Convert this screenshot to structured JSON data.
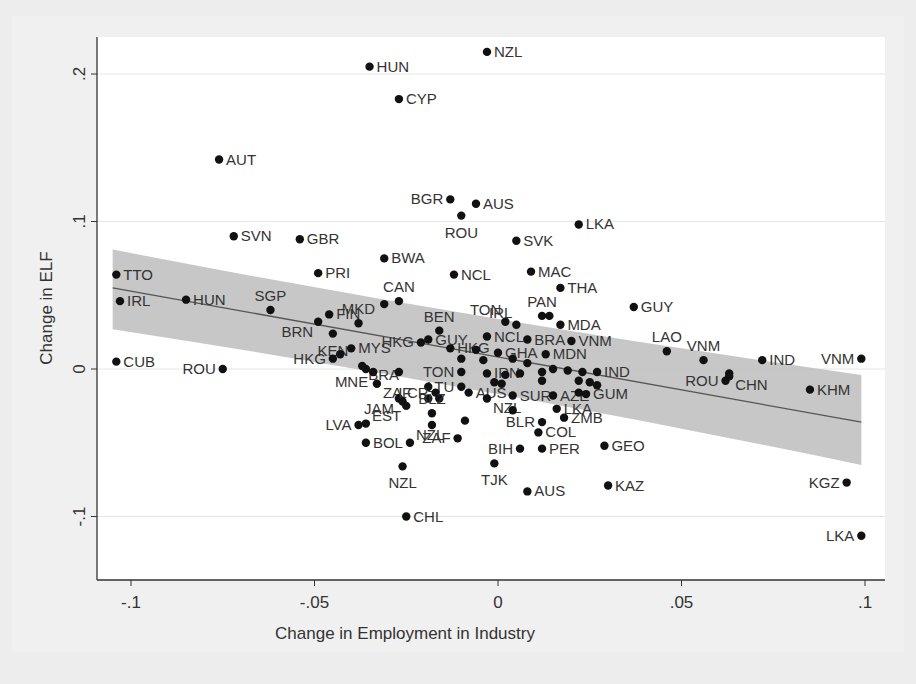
{
  "chart_data": {
    "type": "scatter",
    "title": "",
    "xlabel": "Change in Employment in Industry",
    "ylabel": "Change in ELF",
    "xlim": [
      -0.107,
      0.1
    ],
    "ylim": [
      -0.14,
      0.227
    ],
    "xticks": [
      -0.1,
      -0.05,
      0,
      0.05,
      0.1
    ],
    "xtick_labels": [
      "-.1",
      "-.05",
      "0",
      ".05",
      ".1"
    ],
    "yticks": [
      -0.1,
      0,
      0.1,
      0.2
    ],
    "ytick_labels": [
      "-.1",
      "0",
      ".1",
      ".2"
    ],
    "grid": "horizontal",
    "legend": "none",
    "fit_line": {
      "type": "linear",
      "x": [
        -0.105,
        0.099
      ],
      "y": [
        0.055,
        -0.036
      ],
      "ci_upper": [
        0.081,
        -0.004
      ],
      "ci_lower": [
        0.027,
        -0.065
      ]
    },
    "points": [
      {
        "label": "NZL",
        "x": -0.003,
        "y": 0.215,
        "pos": "right"
      },
      {
        "label": "HUN",
        "x": -0.035,
        "y": 0.205,
        "pos": "right"
      },
      {
        "label": "CYP",
        "x": -0.027,
        "y": 0.183,
        "pos": "right"
      },
      {
        "label": "AUT",
        "x": -0.076,
        "y": 0.142,
        "pos": "right"
      },
      {
        "label": "BGR",
        "x": -0.013,
        "y": 0.115,
        "pos": "left"
      },
      {
        "label": "AUS",
        "x": -0.006,
        "y": 0.112,
        "pos": "right"
      },
      {
        "label": "ROU",
        "x": -0.01,
        "y": 0.104,
        "pos": "below"
      },
      {
        "label": "LKA",
        "x": 0.022,
        "y": 0.098,
        "pos": "right"
      },
      {
        "label": "SVN",
        "x": -0.072,
        "y": 0.09,
        "pos": "right"
      },
      {
        "label": "GBR",
        "x": -0.054,
        "y": 0.088,
        "pos": "right"
      },
      {
        "label": "SVK",
        "x": 0.005,
        "y": 0.087,
        "pos": "right"
      },
      {
        "label": "BWA",
        "x": -0.031,
        "y": 0.075,
        "pos": "right"
      },
      {
        "label": "NCL",
        "x": -0.012,
        "y": 0.064,
        "pos": "right"
      },
      {
        "label": "MAC",
        "x": 0.009,
        "y": 0.066,
        "pos": "right"
      },
      {
        "label": "PRI",
        "x": -0.049,
        "y": 0.065,
        "pos": "right"
      },
      {
        "label": "TTO",
        "x": -0.104,
        "y": 0.064,
        "pos": "right"
      },
      {
        "label": "THA",
        "x": 0.017,
        "y": 0.055,
        "pos": "right"
      },
      {
        "label": "IRL",
        "x": -0.103,
        "y": 0.046,
        "pos": "right"
      },
      {
        "label": "HUN",
        "x": -0.085,
        "y": 0.047,
        "pos": "right"
      },
      {
        "label": "CAN",
        "x": -0.027,
        "y": 0.046,
        "pos": "above"
      },
      {
        "label": "",
        "x": -0.031,
        "y": 0.044,
        "pos": "none"
      },
      {
        "label": "GUY",
        "x": 0.037,
        "y": 0.042,
        "pos": "right"
      },
      {
        "label": "SGP",
        "x": -0.062,
        "y": 0.04,
        "pos": "above"
      },
      {
        "label": "FIN",
        "x": -0.046,
        "y": 0.037,
        "pos": "right"
      },
      {
        "label": "IRL",
        "x": 0.005,
        "y": 0.03,
        "pos": "above-left"
      },
      {
        "label": "PAN",
        "x": 0.012,
        "y": 0.036,
        "pos": "above"
      },
      {
        "label": "",
        "x": 0.014,
        "y": 0.036,
        "pos": "none"
      },
      {
        "label": "BRN",
        "x": -0.049,
        "y": 0.032,
        "pos": "left-below"
      },
      {
        "label": "MKD",
        "x": -0.038,
        "y": 0.031,
        "pos": "above"
      },
      {
        "label": "MDA",
        "x": 0.017,
        "y": 0.03,
        "pos": "right"
      },
      {
        "label": "TON",
        "x": 0.002,
        "y": 0.032,
        "pos": "above-left"
      },
      {
        "label": "BEN",
        "x": -0.016,
        "y": 0.026,
        "pos": "above"
      },
      {
        "label": "KEN",
        "x": -0.045,
        "y": 0.024,
        "pos": "below"
      },
      {
        "label": "NCL",
        "x": -0.003,
        "y": 0.022,
        "pos": "right"
      },
      {
        "label": "BRA",
        "x": 0.008,
        "y": 0.02,
        "pos": "right"
      },
      {
        "label": "VNM",
        "x": 0.02,
        "y": 0.019,
        "pos": "right"
      },
      {
        "label": "GUY",
        "x": -0.019,
        "y": 0.02,
        "pos": "right"
      },
      {
        "label": "HKG",
        "x": -0.021,
        "y": 0.018,
        "pos": "left"
      },
      {
        "label": "LAO",
        "x": 0.046,
        "y": 0.012,
        "pos": "above"
      },
      {
        "label": "HKG",
        "x": -0.013,
        "y": 0.014,
        "pos": "right"
      },
      {
        "label": "MYS",
        "x": -0.04,
        "y": 0.014,
        "pos": "right"
      },
      {
        "label": "HKG",
        "x": -0.045,
        "y": 0.007,
        "pos": "left"
      },
      {
        "label": "",
        "x": -0.043,
        "y": 0.01,
        "pos": "none"
      },
      {
        "label": "GHA",
        "x": 0.0,
        "y": 0.011,
        "pos": "right"
      },
      {
        "label": "MDN",
        "x": 0.013,
        "y": 0.01,
        "pos": "right"
      },
      {
        "label": "VNM",
        "x": 0.056,
        "y": 0.006,
        "pos": "above"
      },
      {
        "label": "IND",
        "x": 0.072,
        "y": 0.006,
        "pos": "right"
      },
      {
        "label": "VNM",
        "x": 0.099,
        "y": 0.007,
        "pos": "left"
      },
      {
        "label": "CUB",
        "x": -0.104,
        "y": 0.005,
        "pos": "right"
      },
      {
        "label": "",
        "x": -0.006,
        "y": 0.013,
        "pos": "none"
      },
      {
        "label": "",
        "x": -0.004,
        "y": 0.006,
        "pos": "none"
      },
      {
        "label": "",
        "x": 0.004,
        "y": 0.007,
        "pos": "none"
      },
      {
        "label": "",
        "x": 0.008,
        "y": 0.004,
        "pos": "none"
      },
      {
        "label": "",
        "x": -0.01,
        "y": 0.007,
        "pos": "none"
      },
      {
        "label": "BRA",
        "x": -0.037,
        "y": 0.002,
        "pos": "right-below"
      },
      {
        "label": "",
        "x": -0.036,
        "y": 0.0,
        "pos": "none"
      },
      {
        "label": "ROU",
        "x": -0.075,
        "y": 0.0,
        "pos": "left"
      },
      {
        "label": "TON",
        "x": -0.01,
        "y": -0.002,
        "pos": "left"
      },
      {
        "label": "IRN",
        "x": -0.003,
        "y": -0.003,
        "pos": "right"
      },
      {
        "label": "",
        "x": 0.012,
        "y": -0.002,
        "pos": "none"
      },
      {
        "label": "",
        "x": 0.015,
        "y": 0.0,
        "pos": "none"
      },
      {
        "label": "",
        "x": 0.019,
        "y": -0.001,
        "pos": "none"
      },
      {
        "label": "",
        "x": 0.023,
        "y": -0.002,
        "pos": "none"
      },
      {
        "label": "IND",
        "x": 0.027,
        "y": -0.002,
        "pos": "right"
      },
      {
        "label": "",
        "x": 0.002,
        "y": -0.004,
        "pos": "none"
      },
      {
        "label": "",
        "x": 0.006,
        "y": -0.003,
        "pos": "none"
      },
      {
        "label": "MNE",
        "x": -0.034,
        "y": -0.002,
        "pos": "left-below"
      },
      {
        "label": "",
        "x": -0.027,
        "y": -0.002,
        "pos": "none"
      },
      {
        "label": "ROU",
        "x": 0.062,
        "y": -0.008,
        "pos": "left"
      },
      {
        "label": "",
        "x": 0.063,
        "y": -0.003,
        "pos": "none"
      },
      {
        "label": "CHN",
        "x": 0.063,
        "y": -0.005,
        "pos": "right-below"
      },
      {
        "label": "",
        "x": -0.001,
        "y": -0.009,
        "pos": "none"
      },
      {
        "label": "",
        "x": 0.001,
        "y": -0.01,
        "pos": "none"
      },
      {
        "label": "",
        "x": 0.012,
        "y": -0.008,
        "pos": "none"
      },
      {
        "label": "",
        "x": 0.022,
        "y": -0.008,
        "pos": "none"
      },
      {
        "label": "",
        "x": 0.025,
        "y": -0.009,
        "pos": "none"
      },
      {
        "label": "",
        "x": 0.027,
        "y": -0.011,
        "pos": "none"
      },
      {
        "label": "LTU",
        "x": -0.01,
        "y": -0.012,
        "pos": "left"
      },
      {
        "label": "",
        "x": -0.019,
        "y": -0.012,
        "pos": "none"
      },
      {
        "label": "KHM",
        "x": 0.085,
        "y": -0.014,
        "pos": "right"
      },
      {
        "label": "ZAF",
        "x": -0.033,
        "y": -0.01,
        "pos": "right-below"
      },
      {
        "label": "JAM",
        "x": -0.027,
        "y": -0.02,
        "pos": "left-below"
      },
      {
        "label": "LCR",
        "x": -0.017,
        "y": -0.016,
        "pos": "left"
      },
      {
        "label": "",
        "x": -0.019,
        "y": -0.02,
        "pos": "none"
      },
      {
        "label": "",
        "x": -0.016,
        "y": -0.02,
        "pos": "none"
      },
      {
        "label": "AUS",
        "x": -0.008,
        "y": -0.016,
        "pos": "right"
      },
      {
        "label": "SUR",
        "x": 0.004,
        "y": -0.018,
        "pos": "right"
      },
      {
        "label": "AZE",
        "x": 0.015,
        "y": -0.018,
        "pos": "right"
      },
      {
        "label": "GUM",
        "x": 0.024,
        "y": -0.017,
        "pos": "right"
      },
      {
        "label": "",
        "x": 0.022,
        "y": -0.016,
        "pos": "none"
      },
      {
        "label": "",
        "x": -0.026,
        "y": -0.022,
        "pos": "none"
      },
      {
        "label": "",
        "x": -0.025,
        "y": -0.025,
        "pos": "none"
      },
      {
        "label": "NZL",
        "x": -0.003,
        "y": -0.02,
        "pos": "right-below"
      },
      {
        "label": "BLZ",
        "x": -0.018,
        "y": -0.03,
        "pos": "above"
      },
      {
        "label": "LKA",
        "x": 0.016,
        "y": -0.027,
        "pos": "right"
      },
      {
        "label": "",
        "x": 0.004,
        "y": -0.028,
        "pos": "none"
      },
      {
        "label": "BLR",
        "x": 0.012,
        "y": -0.036,
        "pos": "left"
      },
      {
        "label": "ZMB",
        "x": 0.018,
        "y": -0.033,
        "pos": "right"
      },
      {
        "label": "",
        "x": -0.009,
        "y": -0.035,
        "pos": "none"
      },
      {
        "label": "LVA",
        "x": -0.038,
        "y": -0.038,
        "pos": "left"
      },
      {
        "label": "EST",
        "x": -0.036,
        "y": -0.037,
        "pos": "right-above"
      },
      {
        "label": "",
        "x": -0.018,
        "y": -0.038,
        "pos": "none"
      },
      {
        "label": "COL",
        "x": 0.011,
        "y": -0.043,
        "pos": "right"
      },
      {
        "label": "BOL",
        "x": -0.036,
        "y": -0.05,
        "pos": "right"
      },
      {
        "label": "NZL",
        "x": -0.024,
        "y": -0.05,
        "pos": "right-above"
      },
      {
        "label": "ZAF",
        "x": -0.011,
        "y": -0.047,
        "pos": "left"
      },
      {
        "label": "BIH",
        "x": 0.006,
        "y": -0.054,
        "pos": "left"
      },
      {
        "label": "PER",
        "x": 0.012,
        "y": -0.054,
        "pos": "right"
      },
      {
        "label": "GEO",
        "x": 0.029,
        "y": -0.052,
        "pos": "right"
      },
      {
        "label": "TJK",
        "x": -0.001,
        "y": -0.064,
        "pos": "below"
      },
      {
        "label": "NZL",
        "x": -0.026,
        "y": -0.066,
        "pos": "below"
      },
      {
        "label": "KAZ",
        "x": 0.03,
        "y": -0.079,
        "pos": "right"
      },
      {
        "label": "KGZ",
        "x": 0.095,
        "y": -0.077,
        "pos": "left"
      },
      {
        "label": "AUS",
        "x": 0.008,
        "y": -0.083,
        "pos": "right"
      },
      {
        "label": "CHL",
        "x": -0.025,
        "y": -0.1,
        "pos": "right"
      },
      {
        "label": "LKA",
        "x": 0.099,
        "y": -0.113,
        "pos": "left"
      }
    ]
  },
  "colors": {
    "outer_background": "#eeeeee",
    "plot_background": "#ffffff",
    "point": "#111111",
    "fit_line": "#555555",
    "ci_band": "#bdbdbd",
    "gridline": "#e6e6e6",
    "axis": "#333333",
    "text": "#333333"
  }
}
